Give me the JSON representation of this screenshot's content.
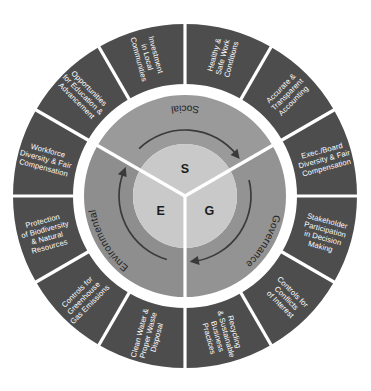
{
  "diagram": {
    "type": "concentric-pie",
    "background_color": "#ffffff",
    "colors": {
      "outer_ring": "#4d4d4d",
      "middle_ring": "#939393",
      "core_disc": "#c9c9c9",
      "divider": "#ffffff",
      "outer_text": "#ffffff",
      "inner_text": "#232323",
      "arrow": "#3a3a3a"
    },
    "center": {
      "cx": 185,
      "cy": 196
    },
    "radii": {
      "outer_edge": 172,
      "outer_inner_edge": 112,
      "ring_gap_outer": 110,
      "ring_gap_inner": 103,
      "middle_outer_edge": 101,
      "core_edge": 52,
      "arrow_radius": 66
    }
  },
  "core": {
    "letters": [
      {
        "id": "e",
        "label": "E"
      },
      {
        "id": "s",
        "label": "S"
      },
      {
        "id": "g",
        "label": "G"
      }
    ]
  },
  "pillars": [
    {
      "id": "environmental",
      "label": "Environmental",
      "letter": "E",
      "start_angle": 180,
      "end_angle": 300,
      "topics": [
        {
          "id": "clean-water",
          "label": [
            "Clean Water &",
            "Proper Waste",
            "Disposal"
          ]
        },
        {
          "id": "greenhouse-gas",
          "label": [
            "Controls for",
            "Greenhouse",
            "Gas Emissions"
          ]
        },
        {
          "id": "biodiversity",
          "label": [
            "Protection",
            "of Biodiversity",
            "& Natural",
            "Resources"
          ]
        }
      ]
    },
    {
      "id": "social",
      "label": "Social",
      "letter": "S",
      "start_angle": 300,
      "end_angle": 60,
      "topics": [
        {
          "id": "workforce-diversity",
          "label": [
            "Workforce",
            "Diversity & Fair",
            "Compensation"
          ]
        },
        {
          "id": "education-advancement",
          "label": [
            "Opportunities",
            "for Education &",
            "Advancement"
          ]
        },
        {
          "id": "local-investment",
          "label": [
            "Investment",
            "in Local",
            "Communities"
          ]
        }
      ]
    },
    {
      "id": "governance",
      "label": "Governance",
      "letter": "G",
      "start_angle": 60,
      "end_angle": 180,
      "topics": [
        {
          "id": "safe-work",
          "label": [
            "Healthy &",
            "Safe Work",
            "Conditions"
          ]
        },
        {
          "id": "transparent-accounting",
          "label": [
            "Accurate &",
            "Transparent",
            "Accounting"
          ]
        },
        {
          "id": "exec-board-diversity",
          "label": [
            "Exec./Board",
            "Diversity & Fair",
            "Compensation"
          ]
        },
        {
          "id": "stakeholder-participation",
          "label": [
            "Stakeholder",
            "Participation",
            "in Decision",
            "Making"
          ]
        },
        {
          "id": "conflicts-of-interest",
          "label": [
            "Controls for",
            "Conflicts",
            "of Interest"
          ]
        },
        {
          "id": "recycling-sustainable",
          "label": [
            "Recycling",
            "& Sustainable",
            "Business",
            "Practices"
          ]
        }
      ]
    }
  ],
  "outer_segments": [
    {
      "id": "biodiversity",
      "pillar": "environmental",
      "start_angle": 240,
      "end_angle": 270,
      "lines": [
        "Protection",
        "of Biodiversity",
        "& Natural",
        "Resources"
      ]
    },
    {
      "id": "greenhouse-gas",
      "pillar": "environmental",
      "start_angle": 210,
      "end_angle": 240,
      "lines": [
        "Controls for",
        "Greenhouse",
        "Gas Emissions"
      ]
    },
    {
      "id": "clean-water",
      "pillar": "environmental",
      "start_angle": 180,
      "end_angle": 210,
      "lines": [
        "Clean Water &",
        "Proper Waste",
        "Disposal"
      ]
    },
    {
      "id": "recycling-sustainable",
      "pillar": "environmental",
      "start_angle": 150,
      "end_angle": 180,
      "lines": [
        "Recycling",
        "& Sustainable",
        "Business",
        "Practices"
      ]
    },
    {
      "id": "conflicts-of-interest",
      "pillar": "governance",
      "start_angle": 120,
      "end_angle": 150,
      "lines": [
        "Controls for",
        "Conflicts",
        "of Interest"
      ]
    },
    {
      "id": "stakeholder-participation",
      "pillar": "governance",
      "start_angle": 90,
      "end_angle": 120,
      "lines": [
        "Stakeholder",
        "Participation",
        "in Decision",
        "Making"
      ]
    },
    {
      "id": "exec-board-diversity",
      "pillar": "governance",
      "start_angle": 60,
      "end_angle": 90,
      "lines": [
        "Exec./Board",
        "Diversity & Fair",
        "Compensation"
      ]
    },
    {
      "id": "transparent-accounting",
      "pillar": "governance",
      "start_angle": 30,
      "end_angle": 60,
      "lines": [
        "Accurate &",
        "Transparent",
        "Accounting"
      ]
    },
    {
      "id": "safe-work",
      "pillar": "governance",
      "start_angle": 0,
      "end_angle": 30,
      "lines": [
        "Healthy &",
        "Safe Work",
        "Conditions"
      ]
    },
    {
      "id": "local-investment",
      "pillar": "social",
      "start_angle": 330,
      "end_angle": 360,
      "lines": [
        "Investment",
        "in Local",
        "Communities"
      ]
    },
    {
      "id": "education-advancement",
      "pillar": "social",
      "start_angle": 300,
      "end_angle": 330,
      "lines": [
        "Opportunities",
        "for Education &",
        "Advancement"
      ]
    },
    {
      "id": "workforce-diversity",
      "pillar": "social",
      "start_angle": 270,
      "end_angle": 300,
      "lines": [
        "Workforce",
        "Diversity & Fair",
        "Compensation"
      ]
    }
  ]
}
